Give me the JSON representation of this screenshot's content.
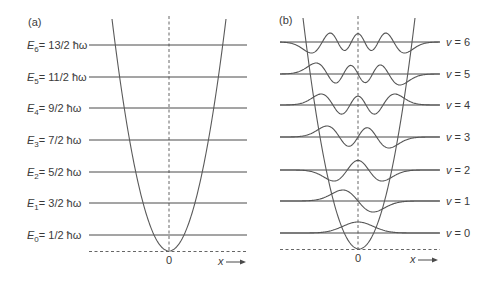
{
  "figure": {
    "panel_a": {
      "label": "(a)",
      "levels": [
        {
          "sym": "E",
          "sub": "6",
          "value": "= 13/2 ħω",
          "y": 45
        },
        {
          "sym": "E",
          "sub": "5",
          "value": "= 11/2 ħω",
          "y": 77
        },
        {
          "sym": "E",
          "sub": "4",
          "value": "= 9/2 ħω",
          "y": 108
        },
        {
          "sym": "E",
          "sub": "3",
          "value": "= 7/2 ħω",
          "y": 140
        },
        {
          "sym": "E",
          "sub": "2",
          "value": "= 5/2 ħω",
          "y": 172
        },
        {
          "sym": "E",
          "sub": "1",
          "value": "= 3/2 ħω",
          "y": 203
        },
        {
          "sym": "E",
          "sub": "0",
          "value": "= 1/2 ħω",
          "y": 235
        }
      ],
      "origin_label": "0",
      "x_axis_label": "x",
      "parabola": {
        "vertex_x": 169,
        "vertex_y": 251,
        "top_y": 19,
        "half_width_at_top": 57
      },
      "line_x_start": 89,
      "line_x_end": 247
    },
    "panel_b": {
      "label": "(b)",
      "levels": [
        {
          "sym": "v",
          "value": " = 6",
          "n": 6,
          "y": 42
        },
        {
          "sym": "v",
          "value": " = 5",
          "n": 5,
          "y": 74
        },
        {
          "sym": "v",
          "value": " = 4",
          "n": 4,
          "y": 105
        },
        {
          "sym": "v",
          "value": " = 3",
          "n": 3,
          "y": 137
        },
        {
          "sym": "v",
          "value": " = 2",
          "n": 2,
          "y": 170
        },
        {
          "sym": "v",
          "value": " = 1",
          "n": 1,
          "y": 201
        },
        {
          "sym": "v",
          "value": " = 0",
          "n": 0,
          "y": 233
        }
      ],
      "origin_label": "0",
      "x_axis_label": "x",
      "parabola": {
        "vertex_x": 359,
        "vertex_y": 249,
        "top_y": 18,
        "half_width_at_top": 56
      },
      "line_x_start": 280,
      "line_x_end": 440,
      "wave_amplitude_px": 11,
      "length_unit_px": 15.2
    },
    "colors": {
      "ink": "#4a4a4a",
      "text": "#3a3a3a"
    }
  }
}
